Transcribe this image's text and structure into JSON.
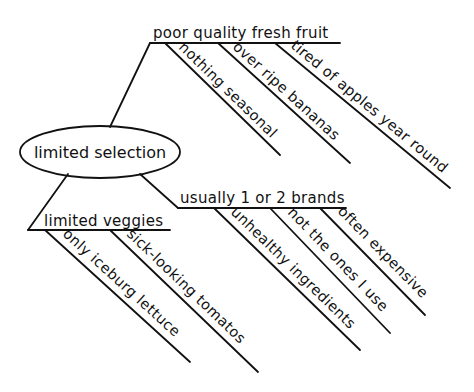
{
  "diagram": {
    "type": "mind-map",
    "style": "hand-drawn",
    "ink_color": "#111111",
    "background": "#ffffff",
    "center": {
      "label": "limited selection"
    },
    "branches": [
      {
        "label": "poor quality fresh fruit",
        "children": [
          {
            "label": "nothing seasonal"
          },
          {
            "label": "over ripe bananas"
          },
          {
            "label": "tired of apples year round"
          }
        ]
      },
      {
        "label": "usually 1 or 2 brands",
        "children": [
          {
            "label": "unhealthy ingredients"
          },
          {
            "label": "not the ones I use"
          },
          {
            "label": "often expensive"
          }
        ]
      },
      {
        "label": "limited veggies",
        "children": [
          {
            "label": "only iceburg lettuce"
          },
          {
            "label": "sick-looking tomatos"
          }
        ]
      }
    ]
  }
}
